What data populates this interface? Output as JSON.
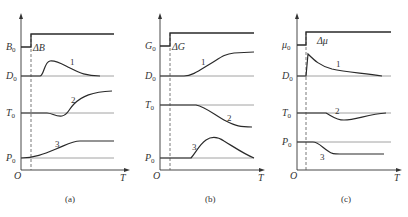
{
  "figure": {
    "panels": [
      {
        "id": "a",
        "caption": "(a)",
        "origin_label": "O",
        "x_axis_label": "T",
        "input": {
          "base": "B",
          "base_sub": "0",
          "delta": "ΔB"
        },
        "outputs": [
          {
            "label": "D",
            "sub": "0",
            "curve_number": "1"
          },
          {
            "label": "T",
            "sub": "0",
            "curve_number": "2"
          },
          {
            "label": "P",
            "sub": "0",
            "curve_number": "3"
          }
        ]
      },
      {
        "id": "b",
        "caption": "(b)",
        "origin_label": "O",
        "x_axis_label": "T",
        "input": {
          "base": "G",
          "base_sub": "0",
          "delta": "ΔG"
        },
        "outputs": [
          {
            "label": "D",
            "sub": "0",
            "curve_number": "1"
          },
          {
            "label": "T",
            "sub": "0",
            "curve_number": "2"
          },
          {
            "label": "P",
            "sub": "0",
            "curve_number": "3"
          }
        ]
      },
      {
        "id": "c",
        "caption": "(c)",
        "origin_label": "O",
        "x_axis_label": "T",
        "input": {
          "base": "μ",
          "base_sub": "0",
          "delta": "Δμ"
        },
        "outputs": [
          {
            "label": "D",
            "sub": "0",
            "curve_number": "1"
          },
          {
            "label": "T",
            "sub": "0",
            "curve_number": "2"
          },
          {
            "label": "P",
            "sub": "0",
            "curve_number": "3"
          }
        ]
      }
    ]
  }
}
